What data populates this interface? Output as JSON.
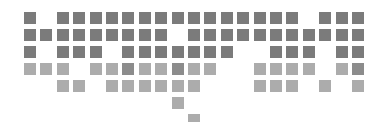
{
  "chart_data": {
    "type": "heatmap",
    "title": "",
    "xlabel": "",
    "ylabel": "",
    "grid": false,
    "legend": "none",
    "columns": 21,
    "rows": 7,
    "layout": {
      "origin_x": 24,
      "origin_y": 12,
      "pitch_x": 16.4,
      "pitch_y": 17,
      "cell_size": 12
    },
    "colors": {
      "dark": "#7b7b7b",
      "medium": "#8c8c8c",
      "light": "#acacac"
    },
    "cells": [
      {
        "row": 0,
        "filled": [
          0,
          2,
          3,
          4,
          5,
          6,
          7,
          8,
          9,
          10,
          11,
          12,
          13,
          14,
          15,
          16,
          18,
          19,
          20
        ],
        "shade": "dark"
      },
      {
        "row": 1,
        "filled": [
          0,
          1,
          2,
          3,
          4,
          5,
          6,
          7,
          8,
          10,
          11,
          12,
          13,
          14,
          15,
          16,
          17,
          18,
          19,
          20
        ],
        "shade": "dark"
      },
      {
        "row": 2,
        "filled": [
          0,
          2,
          3,
          4,
          6,
          7,
          8,
          9,
          10,
          11,
          12,
          15,
          16,
          17,
          19,
          20
        ],
        "shade": "dark"
      },
      {
        "row": 3,
        "filled": [
          0,
          1,
          2,
          4,
          5,
          6,
          7,
          8,
          9,
          10,
          11,
          14,
          15,
          16,
          17,
          19,
          20
        ],
        "shade": "light",
        "medium": [
          6,
          9,
          20
        ]
      },
      {
        "row": 4,
        "filled": [
          2,
          3,
          5,
          6,
          7,
          8,
          9,
          10,
          14,
          15,
          16,
          18,
          20
        ],
        "shade": "light"
      },
      {
        "row": 5,
        "filled": [
          9
        ],
        "shade": "light"
      },
      {
        "row": 6,
        "filled": [
          10
        ],
        "shade": "light"
      }
    ]
  }
}
